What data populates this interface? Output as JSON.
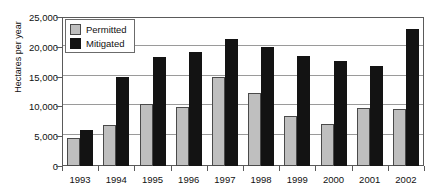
{
  "chart_data": {
    "type": "bar",
    "title": "",
    "xlabel": "",
    "ylabel": "Hectares per year",
    "categories": [
      "1993",
      "1994",
      "1995",
      "1996",
      "1997",
      "1998",
      "1999",
      "2000",
      "2001",
      "2002"
    ],
    "series": [
      {
        "name": "Permitted",
        "color": "#bfbfbf",
        "values": [
          4700,
          6900,
          10400,
          9900,
          14900,
          12200,
          8400,
          7100,
          9800,
          9500
        ]
      },
      {
        "name": "Mitigated",
        "color": "#131313",
        "values": [
          6100,
          15000,
          18300,
          19100,
          21300,
          20000,
          18400,
          17700,
          16800,
          23000
        ]
      }
    ],
    "ylim": [
      0,
      25000
    ],
    "yticks": [
      0,
      5000,
      10000,
      15000,
      20000,
      25000
    ],
    "ytick_labels": [
      "0",
      "5,000",
      "10,000",
      "15,000",
      "20,000",
      "25,000"
    ],
    "grid": true,
    "legend_position": "top-left"
  }
}
